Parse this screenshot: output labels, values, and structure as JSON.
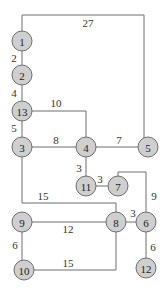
{
  "diagram": {
    "type": "weighted-graph",
    "nodes": [
      {
        "id": "1",
        "label": "1",
        "x": 22,
        "y": 41
      },
      {
        "id": "2",
        "label": "2",
        "x": 22,
        "y": 75
      },
      {
        "id": "13",
        "label": "13",
        "x": 22,
        "y": 111
      },
      {
        "id": "3",
        "label": "3",
        "x": 22,
        "y": 147
      },
      {
        "id": "4",
        "label": "4",
        "x": 86,
        "y": 147
      },
      {
        "id": "5",
        "label": "5",
        "x": 148,
        "y": 147
      },
      {
        "id": "11",
        "label": "11",
        "x": 86,
        "y": 186
      },
      {
        "id": "7",
        "label": "7",
        "x": 118,
        "y": 186
      },
      {
        "id": "9",
        "label": "9",
        "x": 22,
        "y": 222
      },
      {
        "id": "8",
        "label": "8",
        "x": 116,
        "y": 222
      },
      {
        "id": "6",
        "label": "6",
        "x": 146,
        "y": 222
      },
      {
        "id": "10",
        "label": "10",
        "x": 24,
        "y": 270
      },
      {
        "id": "12",
        "label": "12",
        "x": 146,
        "y": 268
      }
    ],
    "edges": [
      {
        "from": "1",
        "to": "5",
        "weight": "27",
        "path": "M22,41 L22,15 L144,15 L144,147",
        "lx": 88,
        "ly": 23
      },
      {
        "from": "1",
        "to": "2",
        "weight": "2",
        "path": "M22,41 L22,75",
        "lx": 14,
        "ly": 58
      },
      {
        "from": "2",
        "to": "13",
        "weight": "4",
        "path": "M22,75 L22,111",
        "lx": 14,
        "ly": 93
      },
      {
        "from": "13",
        "to": "4",
        "weight": "10",
        "path": "M22,111 L86,111 L86,147",
        "lx": 56,
        "ly": 103
      },
      {
        "from": "13",
        "to": "3",
        "weight": "5",
        "path": "M22,111 L22,147",
        "lx": 14,
        "ly": 128
      },
      {
        "from": "3",
        "to": "4",
        "weight": "8",
        "path": "M22,147 L86,147",
        "lx": 56,
        "ly": 140
      },
      {
        "from": "4",
        "to": "5",
        "weight": "7",
        "path": "M86,147 L148,147",
        "lx": 119,
        "ly": 140
      },
      {
        "from": "4",
        "to": "11",
        "weight": "3",
        "path": "M86,147 L86,186",
        "lx": 79,
        "ly": 168
      },
      {
        "from": "11",
        "to": "7",
        "weight": "3",
        "path": "M86,186 L118,186",
        "lx": 100,
        "ly": 179
      },
      {
        "from": "7",
        "to": "6",
        "weight": "9",
        "path": "M118,186 L118,172 L146,172 L146,222",
        "lx": 154,
        "ly": 196
      },
      {
        "from": "3",
        "to": "8",
        "weight": "15",
        "path": "M22,147 L22,203 L116,203 L116,222",
        "lx": 43,
        "ly": 196
      },
      {
        "from": "8",
        "to": "6",
        "weight": "3",
        "path": "M116,222 L146,222",
        "lx": 133,
        "ly": 213
      },
      {
        "from": "9",
        "to": "8",
        "weight": "12",
        "path": "M22,222 L116,222",
        "lx": 68,
        "ly": 229
      },
      {
        "from": "9",
        "to": "10",
        "weight": "6",
        "path": "M22,222 L22,270",
        "lx": 15,
        "ly": 245
      },
      {
        "from": "10",
        "to": "8",
        "weight": "15",
        "path": "M24,270 L116,270 L116,222",
        "lx": 68,
        "ly": 263
      },
      {
        "from": "6",
        "to": "12",
        "weight": "6",
        "path": "M146,222 L146,268",
        "lx": 153,
        "ly": 247
      }
    ],
    "colors": {
      "node_fill": "#cfcfcf",
      "stroke": "#6e6e6e",
      "background": "#ffffff"
    }
  }
}
